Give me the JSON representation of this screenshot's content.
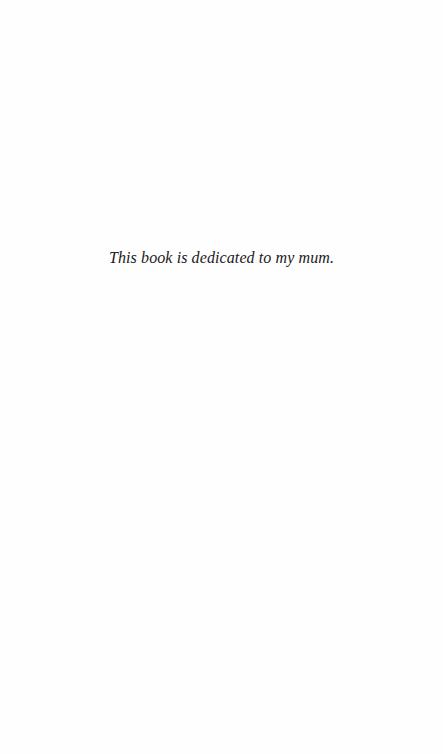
{
  "page": {
    "dedication": "This book is dedicated to my mum."
  }
}
